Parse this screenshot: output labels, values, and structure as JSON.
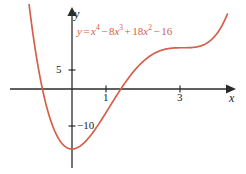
{
  "figure": {
    "background_color": "#ffffff",
    "curve_color": "#d4604a",
    "axis_color": "#1b1b1b"
  },
  "axes": {
    "x_axis_label": "x",
    "y_axis_label": "y",
    "x_ticks": [
      {
        "value": 1,
        "label": "1"
      },
      {
        "value": 3,
        "label": "3"
      }
    ],
    "y_ticks": [
      {
        "value": 5,
        "label": "5"
      },
      {
        "value": -10,
        "label": "−10"
      }
    ]
  },
  "equation": {
    "lhs": "y",
    "eq": "=",
    "terms": [
      {
        "coef": "",
        "var": "x",
        "exp": "4",
        "sign": ""
      },
      {
        "coef": "8",
        "var": "x",
        "exp": "3",
        "sign": "−"
      },
      {
        "coef": "18",
        "var": "x",
        "exp": "2",
        "sign": "+"
      },
      {
        "coef": "16",
        "var": "",
        "exp": "",
        "sign": "−"
      }
    ],
    "plain": "y = x⁴ − 8x³ + 18x² − 16"
  },
  "chart_data": {
    "type": "line",
    "title": "",
    "xlabel": "x",
    "ylabel": "y",
    "function": "y = x^4 - 8x^3 + 18x^2 - 16",
    "xlim": [
      -1.2,
      4.2
    ],
    "ylim": [
      -26,
      22
    ],
    "grid": false,
    "legend": null,
    "annotations": [
      {
        "text": "y = x⁴ − 8x³ + 18x² − 16",
        "x": 0.2,
        "y": 16.5,
        "color": "#d4604a"
      }
    ],
    "series": [
      {
        "name": "y = x^4 - 8x^3 + 18x^2 - 16",
        "color": "#d4604a",
        "x": [
          -1.2,
          -1.1,
          -1.0,
          -0.9,
          -0.8,
          -0.7,
          -0.6,
          -0.5,
          -0.4,
          -0.3,
          -0.2,
          -0.1,
          0.0,
          0.1,
          0.2,
          0.3,
          0.4,
          0.5,
          0.6,
          0.7,
          0.8,
          0.9,
          1.0,
          1.1,
          1.2,
          1.3,
          1.4,
          1.5,
          1.6,
          1.7,
          1.8,
          1.9,
          2.0,
          2.2,
          2.4,
          2.6,
          2.8,
          3.0,
          3.2,
          3.4,
          3.6,
          3.8,
          4.0,
          4.2
        ],
        "y": [
          29.64,
          22.47,
          16.0,
          10.21,
          5.09,
          0.62,
          -3.22,
          -6.44,
          -9.08,
          -11.15,
          -12.68,
          -13.7,
          -16.0,
          -15.82,
          -15.3,
          -14.47,
          -13.36,
          -12.0,
          -10.43,
          -8.69,
          -6.82,
          -4.88,
          -3.0,
          -0.96,
          0.94,
          2.72,
          4.35,
          5.81,
          7.09,
          8.17,
          9.06,
          9.74,
          10.0,
          10.94,
          11.04,
          10.62,
          10.02,
          9.8,
          10.45,
          12.8,
          17.56,
          25.49,
          37.72,
          55.0
        ],
        "note": "Quartic with local min near x=-0.0? actual min about x=0.26 region and global min near x=0.0"
      }
    ],
    "features": {
      "x_intercepts": [
        -1.0,
        1.05
      ],
      "y_intercept": -16,
      "local_minimum_value": -16,
      "plateau_region": [
        2.4,
        3.1
      ]
    }
  }
}
